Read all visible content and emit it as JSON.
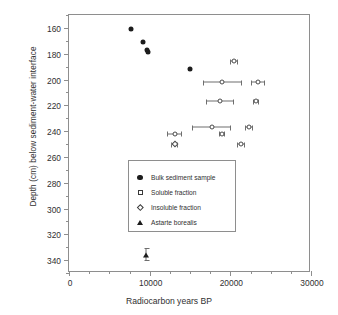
{
  "chart_data": {
    "type": "scatter",
    "title": "",
    "xlabel": "Radiocarbon years BP",
    "ylabel": "Depth (cm) below sediment-water interface",
    "xlim": [
      0,
      30000
    ],
    "ylim": [
      150,
      350
    ],
    "y_inverted": true,
    "grid": false,
    "xticks": [
      0,
      10000,
      20000,
      30000
    ],
    "xtick_labels": [
      "0",
      "10000",
      "20000",
      "30000"
    ],
    "yticks": [
      160,
      180,
      200,
      220,
      240,
      260,
      280,
      300,
      320,
      340
    ],
    "ytick_labels": [
      "160",
      "180",
      "200",
      "220",
      "240",
      "260",
      "280",
      "300",
      "320",
      "340"
    ],
    "legend_position": "center-right-lower",
    "series": [
      {
        "name": "Bulk sediment sample",
        "marker": "filled-circle",
        "points": [
          {
            "x": 7700,
            "y": 161,
            "xerr": 0
          },
          {
            "x": 9200,
            "y": 171,
            "xerr": 0
          },
          {
            "x": 9700,
            "y": 177,
            "xerr": 0
          },
          {
            "x": 9800,
            "y": 179,
            "xerr": 0
          },
          {
            "x": 15000,
            "y": 192,
            "xerr": 0
          }
        ]
      },
      {
        "name": "Soluble fraction",
        "marker": "open-circle",
        "points": [
          {
            "x": 20400,
            "y": 186,
            "xerr": 500
          },
          {
            "x": 19000,
            "y": 202,
            "xerr": 2400
          },
          {
            "x": 23400,
            "y": 202,
            "xerr": 900
          },
          {
            "x": 18700,
            "y": 217,
            "xerr": 1700
          },
          {
            "x": 23200,
            "y": 217,
            "xerr": 400
          },
          {
            "x": 17700,
            "y": 237,
            "xerr": 2400
          },
          {
            "x": 22300,
            "y": 237,
            "xerr": 500
          },
          {
            "x": 13100,
            "y": 242,
            "xerr": 900
          },
          {
            "x": 19000,
            "y": 242,
            "xerr": 400
          },
          {
            "x": 21300,
            "y": 250,
            "xerr": 500
          }
        ]
      },
      {
        "name": "Insoluble fraction",
        "marker": "open-diamond",
        "points": [
          {
            "x": 13100,
            "y": 250,
            "xerr": 400
          }
        ]
      },
      {
        "name": "Astarte borealis",
        "marker": "filled-triangle",
        "points": [
          {
            "x": 9600,
            "y": 336,
            "xerr": 0,
            "yerr": 5
          }
        ]
      }
    ]
  }
}
